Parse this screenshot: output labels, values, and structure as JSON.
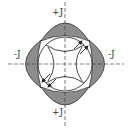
{
  "diagram": {
    "labels": {
      "top": "+J",
      "bottom": "+J",
      "left": "-J",
      "right": "-J"
    },
    "colors": {
      "lobe_fill": "#8c8c8c",
      "stroke": "#333333",
      "axis": "#444444",
      "background": "#ffffff"
    },
    "center": [
      65,
      64
    ],
    "circle_radius": 27,
    "arrows": [
      "top-right-outward",
      "bottom-left-outward"
    ],
    "axes": [
      "horizontal-dashed",
      "vertical-dashed"
    ]
  }
}
